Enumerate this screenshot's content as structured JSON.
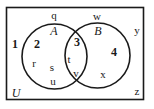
{
  "diagram": {
    "type": "venn",
    "universe": {
      "label": "U"
    },
    "sets": [
      {
        "name": "A"
      },
      {
        "name": "B"
      }
    ],
    "regions": [
      {
        "number": "1",
        "description": "outside A and B"
      },
      {
        "number": "2",
        "description": "A only"
      },
      {
        "number": "3",
        "description": "A and B"
      },
      {
        "number": "4",
        "description": "B only"
      }
    ],
    "elements": {
      "region_1": [
        "q",
        "w",
        "y",
        "z"
      ],
      "region_2": [
        "r",
        "s",
        "u"
      ],
      "region_3": [
        "t",
        "v"
      ],
      "region_4": [
        "x"
      ]
    },
    "labels": {
      "U": "U",
      "A": "A",
      "B": "B",
      "r1": "1",
      "r2": "2",
      "r3": "3",
      "r4": "4",
      "q": "q",
      "w": "w",
      "y": "y",
      "z": "z",
      "r": "r",
      "s": "s",
      "u": "u",
      "t": "t",
      "v": "v",
      "x": "x"
    },
    "colors": {
      "stroke": "#1a1a1a",
      "background": "#ffffff"
    }
  }
}
